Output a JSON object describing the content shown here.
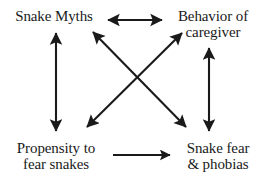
{
  "diagram": {
    "background_color": "#ffffff",
    "stroke_color": "#1a1a1a",
    "nodes": [
      {
        "id": "snake-myths",
        "lines": [
          "Snake Myths"
        ],
        "position": "top-left"
      },
      {
        "id": "behavior-caregiver",
        "lines": [
          "Behavior of",
          "caregiver"
        ],
        "position": "top-right"
      },
      {
        "id": "propensity",
        "lines": [
          "Propensity to",
          "fear snakes"
        ],
        "position": "bottom-left"
      },
      {
        "id": "snake-fear",
        "lines": [
          "Snake fear",
          "& phobias"
        ],
        "position": "bottom-right"
      }
    ],
    "edges": [
      {
        "id": "edge-myths-caregiver",
        "from": "snake-myths",
        "to": "behavior-caregiver",
        "arrowheads": "both",
        "orientation": "horizontal-top"
      },
      {
        "id": "edge-myths-propensity",
        "from": "snake-myths",
        "to": "propensity",
        "arrowheads": "both",
        "orientation": "vertical-left"
      },
      {
        "id": "edge-caregiver-snakefear",
        "from": "behavior-caregiver",
        "to": "snake-fear",
        "arrowheads": "both",
        "orientation": "vertical-right"
      },
      {
        "id": "edge-myths-snakefear",
        "from": "snake-myths",
        "to": "snake-fear",
        "arrowheads": "both",
        "orientation": "diagonal-down-right"
      },
      {
        "id": "edge-caregiver-propensity",
        "from": "behavior-caregiver",
        "to": "propensity",
        "arrowheads": "both",
        "orientation": "diagonal-down-left"
      },
      {
        "id": "edge-propensity-snakefear",
        "from": "propensity",
        "to": "snake-fear",
        "arrowheads": "end",
        "orientation": "horizontal-bottom"
      }
    ]
  }
}
